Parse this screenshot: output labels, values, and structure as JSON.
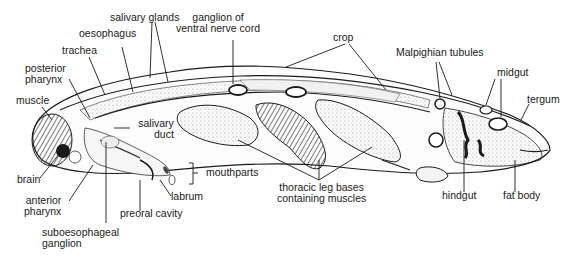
{
  "diagram": {
    "colors": {
      "ink": "#1a1a1a",
      "background": "#ffffff",
      "tissue_fill": "#f2f2f2",
      "stipple": "#9a9a9a"
    },
    "labels": {
      "salivary_glands": "salivary glands",
      "oesophagus": "oesophagus",
      "trachea": "trachea",
      "posterior_pharynx": [
        "posterior",
        "pharynx"
      ],
      "muscle": "muscle",
      "ganglion_ventral_nerve_cord": [
        "ganglion of",
        "ventral nerve cord"
      ],
      "crop": "crop",
      "malpighian_tubules": "Malpighian tubules",
      "midgut": "midgut",
      "tergum": "tergum",
      "salivary_duct": [
        "salivary",
        "duct"
      ],
      "brain": "brain",
      "anterior_pharynx": [
        "anterior",
        "pharynx"
      ],
      "mouthparts": "mouthparts",
      "labrum": "labrum",
      "preoral_cavity": "preoral cavity",
      "suboesophageal_ganglion": [
        "suboesophageal",
        "ganglion"
      ],
      "thoracic_leg_bases": [
        "thoracic leg bases",
        "containing muscles"
      ],
      "hindgut": "hindgut",
      "fat_body": "fat body"
    }
  }
}
